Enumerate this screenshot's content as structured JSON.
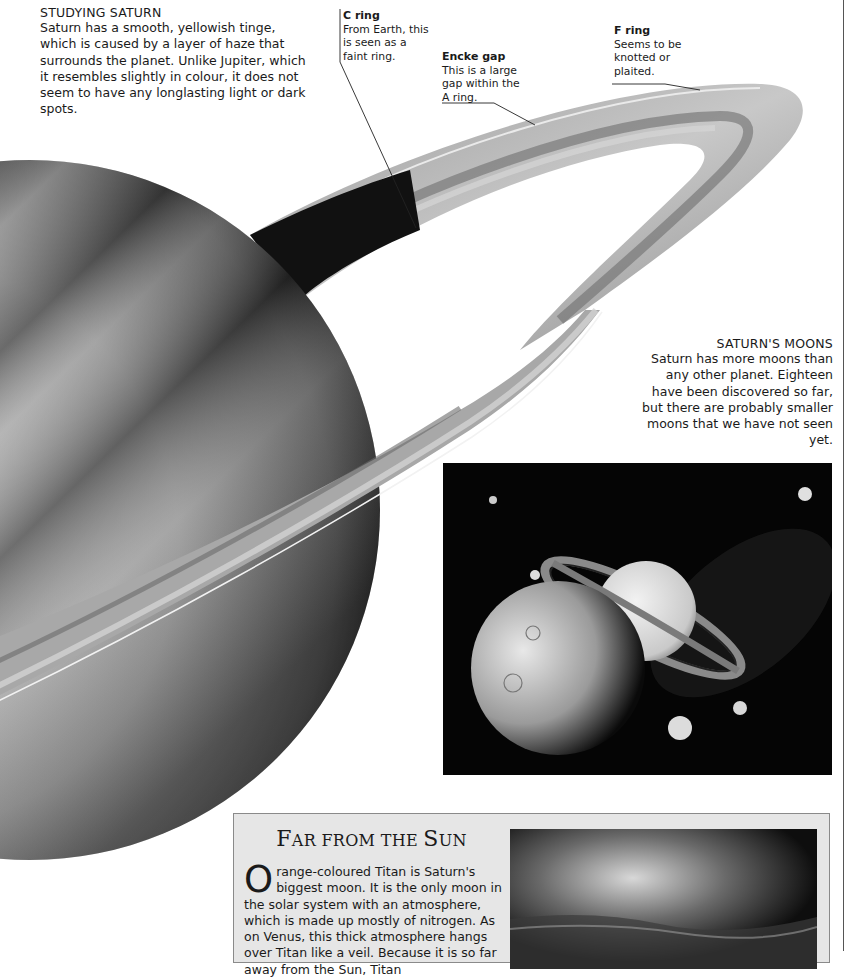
{
  "studying_saturn": {
    "heading": "STUDYING SATURN",
    "body": "Saturn has a smooth, yellowish tinge, which is caused by a layer of haze that surrounds the planet. Unlike Jupiter, which it resembles slightly in colour, it does not seem to have any longlasting light or dark spots."
  },
  "labels": {
    "c_ring": {
      "title": "C ring",
      "text": "From Earth, this is seen as a faint ring."
    },
    "encke_gap": {
      "title": "Encke gap",
      "text": "This is a large gap within the A ring."
    },
    "f_ring": {
      "title": "F ring",
      "text": "Seems to be knotted or plaited."
    }
  },
  "saturns_moons": {
    "heading": "SATURN'S MOONS",
    "body": "Saturn has more moons than any other planet. Eighteen have been discovered so far, but there are probably smaller moons that we have not seen yet."
  },
  "titan_panel": {
    "title_initial_1": "F",
    "title_rest_1": "AR FROM THE ",
    "title_initial_2": "S",
    "title_rest_2": "UN",
    "dropcap": "O",
    "body": "range-coloured Titan is Saturn's biggest moon. It is the only moon in the solar system with an atmosphere, which is made up mostly of nitrogen. As on Venus, this thick atmosphere hangs over Titan like a veil. Because it is so far away from the Sun, Titan"
  },
  "colors": {
    "page_bg": "#ffffff",
    "panel_bg": "#e6e6e6",
    "panel_border": "#8a8a8a",
    "photo_bg": "#050505",
    "text": "#1a1a1a"
  }
}
